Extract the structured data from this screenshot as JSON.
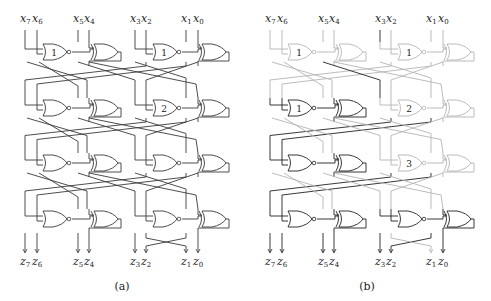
{
  "figure": {
    "panels": [
      {
        "id": "a",
        "caption": "(a)",
        "offset_x": 0,
        "inputs": [
          {
            "var": "x",
            "sub": "7"
          },
          {
            "var": "x",
            "sub": "6"
          },
          {
            "var": "x",
            "sub": "5"
          },
          {
            "var": "x",
            "sub": "4"
          },
          {
            "var": "x",
            "sub": "3"
          },
          {
            "var": "x",
            "sub": "2"
          },
          {
            "var": "x",
            "sub": "1"
          },
          {
            "var": "x",
            "sub": "0"
          }
        ],
        "outputs": [
          {
            "var": "z",
            "sub": "7"
          },
          {
            "var": "z",
            "sub": "6"
          },
          {
            "var": "z",
            "sub": "5"
          },
          {
            "var": "z",
            "sub": "4"
          },
          {
            "var": "z",
            "sub": "3"
          },
          {
            "var": "z",
            "sub": "2"
          },
          {
            "var": "z",
            "sub": "1"
          },
          {
            "var": "z",
            "sub": "0"
          }
        ],
        "gate_labels": {
          "r0_left": "1",
          "r0_right": "1",
          "r1_left": "",
          "r1_right": "2",
          "r2_left": "",
          "r2_right": "",
          "r3_left": "",
          "r3_right": ""
        },
        "highlight": false
      },
      {
        "id": "b",
        "caption": "(b)",
        "offset_x": 245,
        "inputs": [
          {
            "var": "x",
            "sub": "7"
          },
          {
            "var": "x",
            "sub": "6"
          },
          {
            "var": "x",
            "sub": "5"
          },
          {
            "var": "x",
            "sub": "4"
          },
          {
            "var": "x",
            "sub": "3"
          },
          {
            "var": "x",
            "sub": "2"
          },
          {
            "var": "x",
            "sub": "1"
          },
          {
            "var": "x",
            "sub": "0"
          }
        ],
        "outputs": [
          {
            "var": "z",
            "sub": "7"
          },
          {
            "var": "z",
            "sub": "6"
          },
          {
            "var": "z",
            "sub": "5"
          },
          {
            "var": "z",
            "sub": "4"
          },
          {
            "var": "z",
            "sub": "3"
          },
          {
            "var": "z",
            "sub": "2"
          },
          {
            "var": "z",
            "sub": "1"
          },
          {
            "var": "z",
            "sub": "0"
          }
        ],
        "gate_labels": {
          "r0_left": "1",
          "r0_right": "1",
          "r1_left": "1",
          "r1_right": "2",
          "r2_left": "",
          "r2_right": "3",
          "r3_left": "",
          "r3_right": ""
        },
        "highlight": true
      }
    ],
    "colors": {
      "wire": "#3a3a3a",
      "faded": "#b4b4b4",
      "bold": "#222222"
    }
  }
}
